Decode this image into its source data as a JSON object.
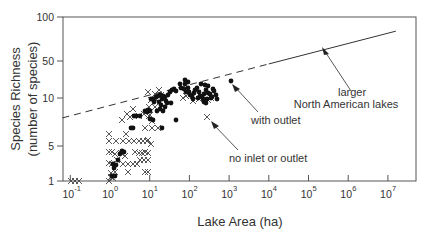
{
  "chart_data": {
    "type": "scatter",
    "title": "",
    "xlabel": "Lake Area (ha)",
    "ylabel_line1": "Species Richness",
    "ylabel_line2": "(number of species)",
    "x_scale": "log",
    "y_scale": "log",
    "xlim": [
      0.1,
      10000000
    ],
    "ylim": [
      1,
      100
    ],
    "x_ticks": [
      {
        "base": "10",
        "exp": "-1",
        "value": 0.1
      },
      {
        "base": "10",
        "exp": "0",
        "value": 1
      },
      {
        "base": "10",
        "exp": "1",
        "value": 10
      },
      {
        "base": "10",
        "exp": "2",
        "value": 100
      },
      {
        "base": "10",
        "exp": "3",
        "value": 1000
      },
      {
        "base": "10",
        "exp": "4",
        "value": 10000
      },
      {
        "base": "10",
        "exp": "5",
        "value": 100000
      },
      {
        "base": "10",
        "exp": "6",
        "value": 1000000
      },
      {
        "base": "10",
        "exp": "7",
        "value": 10000000
      }
    ],
    "y_ticks": [
      {
        "label": "100",
        "value": 100
      },
      {
        "label": "50",
        "value": 50
      },
      {
        "label": "10",
        "value": 10
      },
      {
        "label": "5",
        "value": 5
      },
      {
        "label": "1",
        "value": 1
      }
    ],
    "grid": false,
    "legend": null,
    "series": [
      {
        "name": "with outlet",
        "marker": "filled-circle",
        "points_px": [
          [
            113,
            164
          ],
          [
            114,
            168
          ],
          [
            116,
            165
          ],
          [
            112,
            176
          ],
          [
            115,
            176
          ],
          [
            118,
            160
          ],
          [
            120,
            154
          ],
          [
            122,
            151
          ],
          [
            124,
            152
          ],
          [
            131,
            128
          ],
          [
            133,
            128
          ],
          [
            134,
            116
          ],
          [
            136,
            116
          ],
          [
            140,
            116
          ],
          [
            145,
            111
          ],
          [
            147,
            112
          ],
          [
            148,
            110
          ],
          [
            150,
            111
          ],
          [
            151,
            99
          ],
          [
            153,
            99
          ],
          [
            156,
            97
          ],
          [
            158,
            96
          ],
          [
            160,
            95
          ],
          [
            163,
            96
          ],
          [
            165,
            97
          ],
          [
            168,
            95
          ],
          [
            170,
            92
          ],
          [
            172,
            90
          ],
          [
            174,
            89
          ],
          [
            176,
            91
          ],
          [
            154,
            102
          ],
          [
            159,
            102
          ],
          [
            161,
            105
          ],
          [
            162,
            99
          ],
          [
            166,
            101
          ],
          [
            167,
            103
          ],
          [
            171,
            103
          ],
          [
            157,
            111
          ],
          [
            163,
            111
          ],
          [
            165,
            107
          ],
          [
            150,
            119
          ],
          [
            153,
            120
          ],
          [
            160,
            109
          ],
          [
            162,
            128
          ],
          [
            176,
            120
          ],
          [
            180,
            84
          ],
          [
            181,
            88
          ],
          [
            184,
            89
          ],
          [
            185,
            84
          ],
          [
            186,
            92
          ],
          [
            188,
            88
          ],
          [
            189,
            92
          ],
          [
            190,
            95
          ],
          [
            192,
            96
          ],
          [
            194,
            93
          ],
          [
            195,
            90
          ],
          [
            197,
            88
          ],
          [
            199,
            92
          ],
          [
            200,
            96
          ],
          [
            202,
            97
          ],
          [
            204,
            94
          ],
          [
            206,
            90
          ],
          [
            208,
            93
          ],
          [
            210,
            94
          ],
          [
            211,
            98
          ],
          [
            203,
            99
          ],
          [
            198,
            98
          ],
          [
            193,
            99
          ],
          [
            207,
            99
          ],
          [
            212,
            97
          ],
          [
            208,
            86
          ],
          [
            213,
            89
          ],
          [
            185,
            80
          ],
          [
            188,
            82
          ],
          [
            201,
            84
          ],
          [
            205,
            85
          ],
          [
            214,
            91
          ],
          [
            216,
            95
          ],
          [
            217,
            99
          ],
          [
            206,
            103
          ],
          [
            204,
            102
          ],
          [
            231,
            81
          ]
        ]
      },
      {
        "name": "no inlet or outlet",
        "marker": "x",
        "points_px": [
          [
            71,
            181
          ],
          [
            75,
            181
          ],
          [
            79,
            181
          ],
          [
            109,
            181
          ],
          [
            111,
            177
          ],
          [
            113,
            178
          ],
          [
            111,
            173
          ],
          [
            115,
            172
          ],
          [
            128,
            172
          ],
          [
            145,
            172
          ],
          [
            148,
            172
          ],
          [
            109,
            163
          ],
          [
            112,
            164
          ],
          [
            123,
            164
          ],
          [
            128,
            164
          ],
          [
            133,
            164
          ],
          [
            137,
            164
          ],
          [
            140,
            160
          ],
          [
            144,
            160
          ],
          [
            148,
            160
          ],
          [
            117,
            160
          ],
          [
            109,
            152
          ],
          [
            112,
            152
          ],
          [
            115,
            154
          ],
          [
            125,
            156
          ],
          [
            121,
            153
          ],
          [
            135,
            152
          ],
          [
            139,
            153
          ],
          [
            142,
            153
          ],
          [
            145,
            152
          ],
          [
            148,
            153
          ],
          [
            109,
            141
          ],
          [
            116,
            141
          ],
          [
            123,
            141
          ],
          [
            129,
            141
          ],
          [
            134,
            141
          ],
          [
            139,
            141
          ],
          [
            143,
            141
          ],
          [
            147,
            141
          ],
          [
            109,
            134
          ],
          [
            126,
            134
          ],
          [
            145,
            128
          ],
          [
            152,
            128
          ],
          [
            158,
            128
          ],
          [
            130,
            117
          ],
          [
            139,
            116
          ],
          [
            144,
            114
          ],
          [
            149,
            116
          ],
          [
            122,
            120
          ],
          [
            127,
            114
          ],
          [
            133,
            109
          ],
          [
            149,
            107
          ],
          [
            155,
            107
          ],
          [
            151,
            100
          ],
          [
            155,
            94
          ],
          [
            156,
            100
          ],
          [
            159,
            90
          ],
          [
            161,
            95
          ],
          [
            148,
            92
          ],
          [
            150,
            115
          ],
          [
            152,
            121
          ],
          [
            183,
            98
          ],
          [
            186,
            96
          ],
          [
            193,
            101
          ],
          [
            199,
            99
          ],
          [
            211,
            98
          ],
          [
            208,
            100
          ],
          [
            151,
            144
          ],
          [
            148,
            140
          ],
          [
            207,
            117
          ]
        ]
      },
      {
        "name": "larger North American lakes",
        "type": "line",
        "x_from_log10": 4.0,
        "y_from": 44,
        "x_to_log10": 7.2,
        "y_to": 80
      },
      {
        "name": "fitted extrapolation (dashed)",
        "type": "dashed-line",
        "x_from_log10": -1.2,
        "y_from": 7.5,
        "x_to_log10": 4.0,
        "y_to": 44
      }
    ],
    "annotations": [
      {
        "text_lines": [
          "larger",
          "North American lakes"
        ],
        "target": "solid line near 10^4.7"
      },
      {
        "text_lines": [
          "with outlet"
        ],
        "target": "filled point near 10^3"
      },
      {
        "text_lines": [
          "no inlet or outlet"
        ],
        "target": "x point near 10^2.4"
      }
    ]
  },
  "labels": {
    "xlabel": "Lake Area (ha)",
    "ylabel_line1": "Species Richness",
    "ylabel_line2": "(number of species)",
    "annot_larger_1": "larger",
    "annot_larger_2": "North American lakes",
    "annot_outlet": "with outlet",
    "annot_noinlet": "no inlet or outlet"
  }
}
